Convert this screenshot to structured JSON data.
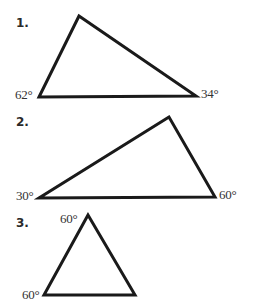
{
  "problems": [
    {
      "number": "1.",
      "angles": {
        "bottom_left": "62°",
        "bottom_right": "34°"
      },
      "vertices": {
        "top": [
          79,
          16
        ],
        "bottom_left": [
          39,
          97
        ],
        "bottom_right": [
          196,
          96
        ]
      }
    },
    {
      "number": "2.",
      "angles": {
        "bottom_left": "30°",
        "bottom_right": "60°"
      },
      "vertices": {
        "top": [
          169,
          117
        ],
        "bottom_left": [
          39,
          198
        ],
        "bottom_right": [
          215,
          197
        ]
      }
    },
    {
      "number": "3.",
      "angles": {
        "top": "60°",
        "bottom_left": "60°"
      },
      "vertices": {
        "top": [
          88,
          215
        ],
        "bottom_left": [
          44,
          295
        ],
        "bottom_right": [
          135,
          295
        ]
      }
    }
  ],
  "style": {
    "stroke_color": "#1a1a1a",
    "stroke_width": 3
  }
}
